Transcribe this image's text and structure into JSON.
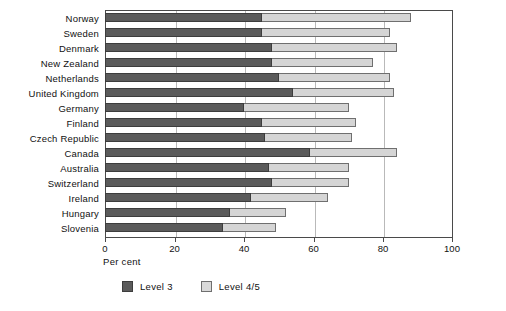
{
  "chart_data": {
    "type": "bar",
    "orientation": "horizontal",
    "stacked": true,
    "title": "",
    "xlabel": "Per cent",
    "ylabel": "",
    "xlim": [
      0,
      100
    ],
    "xticks": [
      0,
      20,
      40,
      60,
      80,
      100
    ],
    "xtick_labels": [
      "0",
      "20",
      "40",
      "60",
      "80",
      "100"
    ],
    "grid": "vertical",
    "legend_position": "bottom-left",
    "categories": [
      "Norway",
      "Sweden",
      "Denmark",
      "New Zealand",
      "Netherlands",
      "United Kingdom",
      "Germany",
      "Finland",
      "Czech Republic",
      "Canada",
      "Australia",
      "Switzerland",
      "Ireland",
      "Hungary",
      "Slovenia"
    ],
    "series": [
      {
        "name": "Level 3",
        "color": "#5b5b5b",
        "values": [
          45,
          45,
          48,
          48,
          50,
          54,
          40,
          45,
          46,
          59,
          47,
          48,
          42,
          36,
          34
        ]
      },
      {
        "name": "Level 4/5",
        "color": "#d5d5d5",
        "values": [
          43,
          37,
          36,
          29,
          32,
          29,
          30,
          27,
          25,
          25,
          23,
          22,
          22,
          16,
          15
        ]
      }
    ],
    "totals": [
      88,
      82,
      84,
      77,
      82,
      83,
      70,
      72,
      71,
      84,
      70,
      70,
      64,
      52,
      49
    ]
  },
  "legend": {
    "items": [
      {
        "label": "Level 3",
        "swatch": "level3"
      },
      {
        "label": "Level 4/5",
        "swatch": "level45"
      }
    ]
  },
  "axis": {
    "x_title": "Per cent"
  }
}
